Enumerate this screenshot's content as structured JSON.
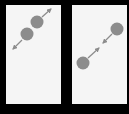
{
  "diagram": {
    "background_color": "#000000",
    "panel_color": "#f5f5f5",
    "circle_color": "#8c8c8c",
    "arrow_color": "#8c8c8c",
    "panels": [
      {
        "id": "left",
        "description": "two circles overlapping, arrows pointing outward (apart)",
        "circles": [
          {
            "cx": 27,
            "cy": 34,
            "r": 6.5
          },
          {
            "cx": 37,
            "cy": 22,
            "r": 6.5
          }
        ],
        "arrows": [
          {
            "x1": 22,
            "y1": 40,
            "x2": 13,
            "y2": 49
          },
          {
            "x1": 42,
            "y1": 17,
            "x2": 51,
            "y2": 9
          }
        ]
      },
      {
        "id": "right",
        "description": "two circles separated, arrows pointing inward (together)",
        "circles": [
          {
            "cx": 83,
            "cy": 63,
            "r": 6.5
          },
          {
            "cx": 117,
            "cy": 29,
            "r": 6.5
          }
        ],
        "arrows": [
          {
            "x1": 88,
            "y1": 58,
            "x2": 99,
            "y2": 48
          },
          {
            "x1": 112,
            "y1": 34,
            "x2": 103,
            "y2": 43
          }
        ]
      }
    ]
  }
}
